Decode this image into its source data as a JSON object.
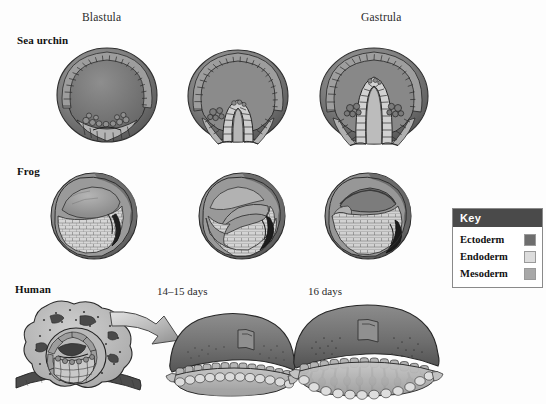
{
  "figure": {
    "background_color": "#fdfdfd",
    "column_headers": [
      {
        "label": "Blastula",
        "x": 82,
        "y": 11
      },
      {
        "label": "Gastrula",
        "x": 361,
        "y": 11
      }
    ],
    "row_labels": [
      {
        "label": "Sea urchin",
        "x": 17,
        "y": 34
      },
      {
        "label": "Frog",
        "x": 17,
        "y": 165
      },
      {
        "label": "Human",
        "x": 15,
        "y": 283
      }
    ],
    "stage_labels": [
      {
        "label": "14–15 days",
        "x": 157,
        "y": 285
      },
      {
        "label": "16 days",
        "x": 308,
        "y": 285
      }
    ]
  },
  "legend": {
    "title": "Key",
    "header_bg": "#4a4a4a",
    "header_fg": "#ffffff",
    "border_color": "#8a8a8a",
    "items": [
      {
        "label": "Ectoderm",
        "color": "#6e6e6e"
      },
      {
        "label": "Endoderm",
        "color": "#dcdcdc"
      },
      {
        "label": "Mesoderm",
        "color": "#a8a8a8"
      }
    ]
  },
  "specimens": {
    "sea_urchin_blastula": {
      "x": 55,
      "y": 46,
      "w": 105,
      "h": 98
    },
    "sea_urchin_mid_gastrula": {
      "x": 186,
      "y": 48,
      "w": 104,
      "h": 97
    },
    "sea_urchin_gastrula": {
      "x": 318,
      "y": 46,
      "w": 112,
      "h": 100
    },
    "frog_blastula": {
      "x": 48,
      "y": 172,
      "w": 92,
      "h": 88
    },
    "frog_mid_gastrula": {
      "x": 196,
      "y": 172,
      "w": 92,
      "h": 88
    },
    "frog_gastrula": {
      "x": 322,
      "y": 172,
      "w": 92,
      "h": 88
    },
    "human_blastocyst": {
      "x": 14,
      "y": 296,
      "w": 150,
      "h": 104
    },
    "human_arrow": {
      "x": 108,
      "y": 310,
      "w": 72,
      "h": 48
    },
    "human_14_15_days": {
      "x": 164,
      "y": 310,
      "w": 130,
      "h": 90
    },
    "human_16_days": {
      "x": 286,
      "y": 300,
      "w": 156,
      "h": 100
    }
  },
  "tissue_colors": {
    "ectoderm": "#6e6e6e",
    "endoderm": "#dcdcdc",
    "mesoderm": "#a8a8a8",
    "outline": "#2a2a2a",
    "shadow": "#555555",
    "highlight": "#bdbdbd"
  }
}
